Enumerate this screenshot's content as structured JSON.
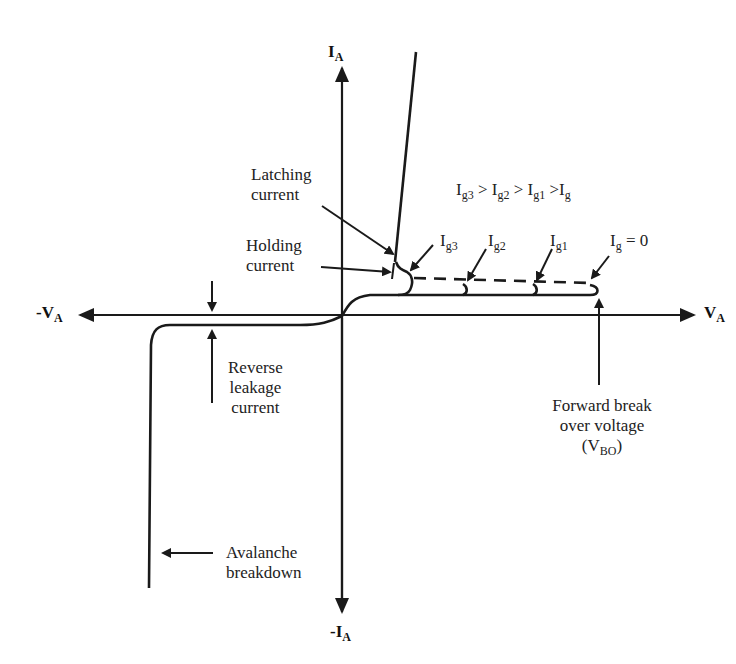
{
  "diagram": {
    "axes": {
      "y_pos": {
        "main": "I",
        "sub": "A"
      },
      "y_neg": {
        "main": "-I",
        "sub": "A"
      },
      "x_pos": {
        "main": "V",
        "sub": "A"
      },
      "x_neg": {
        "main": "-V",
        "sub": "A"
      }
    },
    "labels": {
      "latching": [
        "Latching",
        "current"
      ],
      "holding": [
        "Holding",
        "current"
      ],
      "reverse_leakage": [
        "Reverse",
        "leakage",
        "current"
      ],
      "avalanche": [
        "Avalanche",
        "breakdown"
      ],
      "forward_breakover": [
        "Forward break",
        "over voltage"
      ],
      "vbo": {
        "open": "(V",
        "sub": "BO",
        "close": ")"
      }
    },
    "gate_relation": {
      "parts": [
        {
          "main": "I",
          "sub": "g3"
        },
        {
          "main": " > I",
          "sub": "g2"
        },
        {
          "main": " > I",
          "sub": "g1"
        },
        {
          "main": " >I",
          "sub": "g"
        }
      ]
    },
    "gate_curves": [
      {
        "main": "I",
        "sub": "g3",
        "suffix": ""
      },
      {
        "main": "I",
        "sub": "g2",
        "suffix": ""
      },
      {
        "main": "I",
        "sub": "g1",
        "suffix": ""
      },
      {
        "main": "I",
        "sub": "g",
        "suffix": " = 0"
      }
    ],
    "colors": {
      "line": "#1a1a1a",
      "background": "#ffffff"
    }
  }
}
